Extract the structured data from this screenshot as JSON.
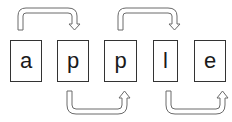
{
  "diagram": {
    "word": "apple",
    "letters": [
      {
        "char": "a",
        "x": 10,
        "y": 40,
        "w": 32,
        "h": 42
      },
      {
        "char": "p",
        "x": 57,
        "y": 40,
        "w": 32,
        "h": 42
      },
      {
        "char": "p",
        "x": 104,
        "y": 40,
        "w": 33,
        "h": 42
      },
      {
        "char": "l",
        "x": 153,
        "y": 40,
        "w": 25,
        "h": 42
      },
      {
        "char": "e",
        "x": 194,
        "y": 40,
        "w": 32,
        "h": 42
      }
    ],
    "arrows": [
      {
        "from": 0,
        "to": 1,
        "side": "top"
      },
      {
        "from": 2,
        "to": 3,
        "side": "top"
      },
      {
        "from": 1,
        "to": 2,
        "side": "bottom"
      },
      {
        "from": 3,
        "to": 4,
        "side": "bottom"
      }
    ],
    "colors": {
      "stroke": "#555555",
      "border": "#333333",
      "text": "#1a1a1a"
    }
  }
}
